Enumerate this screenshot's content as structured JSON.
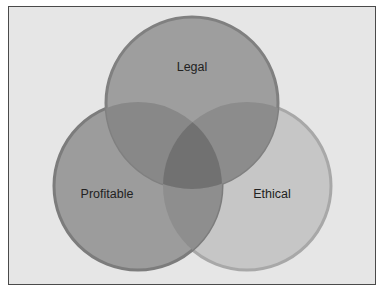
{
  "diagram": {
    "type": "venn",
    "sets": [
      {
        "id": "legal",
        "label": "Legal",
        "fill": "#9a9a9a",
        "stroke": "#7e7e7e",
        "cx": 192,
        "cy": 103,
        "r": 86
      },
      {
        "id": "profitable",
        "label": "Profitable",
        "fill": "#999999",
        "stroke": "#7a7a7a",
        "cx": 138,
        "cy": 186,
        "r": 84
      },
      {
        "id": "ethical",
        "label": "Ethical",
        "fill": "#c4c4c4",
        "stroke": "#a4a4a4",
        "cx": 247,
        "cy": 186,
        "r": 84
      }
    ],
    "colors": {
      "background": "#e6e6e6",
      "frame": "#4a4a4a",
      "legal_profitable_overlap": "#868686",
      "legal_ethical_overlap": "#8c8c8c",
      "profitable_ethical_overlap": "#8e8e8e",
      "center_overlap": "#6f6f6f"
    }
  }
}
